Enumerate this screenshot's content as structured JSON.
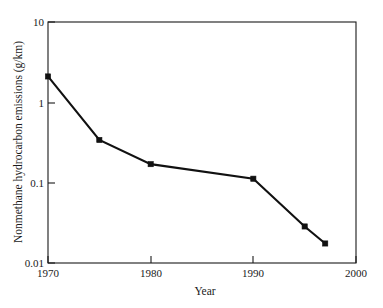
{
  "chart_data": {
    "type": "line",
    "title": "",
    "xlabel": "Year",
    "ylabel": "Nonmethane hydrocarbon emissions (g/km)",
    "xlim": [
      1970,
      2000
    ],
    "ylim": [
      0.01,
      10
    ],
    "yscale": "log",
    "xscale": "linear",
    "grid": false,
    "legend": false,
    "x": [
      1970,
      1975,
      1980,
      1990,
      1995,
      1997
    ],
    "values": [
      2.1,
      0.34,
      0.17,
      0.112,
      0.0285,
      0.0175
    ],
    "series": [
      {
        "name": "Nonmethane hydrocarbon emissions",
        "x": [
          1970,
          1975,
          1980,
          1990,
          1995,
          1997
        ],
        "values": [
          2.1,
          0.34,
          0.17,
          0.112,
          0.0285,
          0.0175
        ],
        "marker": "square",
        "color": "#111111"
      }
    ],
    "xticks": [
      1970,
      1980,
      1990,
      2000
    ],
    "xtick_labels": [
      "1970",
      "1980",
      "1990",
      "2000"
    ],
    "yticks": [
      0.01,
      0.1,
      1,
      10
    ],
    "ytick_labels": [
      "0.01",
      "0.1",
      "1",
      "10"
    ]
  },
  "axes": {
    "y_title": "Nonmethane hydrocarbon emissions (g/km)",
    "x_title": "Year",
    "y_tick_0": "0.01",
    "y_tick_1": "0.1",
    "y_tick_2": "1",
    "y_tick_3": "10",
    "x_tick_0": "1970",
    "x_tick_1": "1980",
    "x_tick_2": "1990",
    "x_tick_3": "2000"
  },
  "colors": {
    "line": "#111111",
    "frame": "#1a1a1a",
    "background": "#ffffff",
    "text": "#1a1a1a"
  }
}
